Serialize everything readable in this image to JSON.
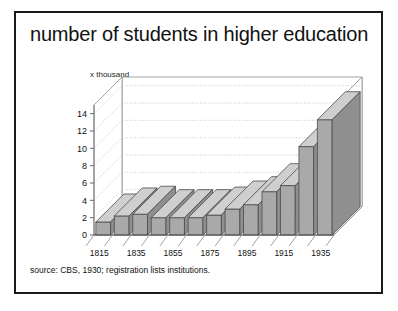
{
  "figure": {
    "title": "number of students in higher education",
    "source": "source: CBS, 1930; registration lists institutions.",
    "unit_label": "x thousand",
    "colors": {
      "panel_background": "#ffffff",
      "panel_border": "#1a1a1a",
      "bar_front": "#a9a9a9",
      "bar_side": "#8f8f8f",
      "bar_top": "#cfcfcf",
      "bar_outline": "#4a4a4a",
      "floor": "#ffffff",
      "gridline": "#bdbdbd",
      "axis": "#8a8a8a",
      "text": "#111111"
    }
  },
  "chart_data": {
    "type": "bar",
    "title": "number of students in higher education",
    "subtitle": "",
    "xlabel": "",
    "ylabel": "x thousand",
    "ylim": [
      0,
      15
    ],
    "yticks": [
      0,
      2,
      4,
      6,
      8,
      10,
      12,
      14
    ],
    "ytick_labels": [
      "0",
      "2",
      "4",
      "6",
      "8",
      "10",
      "12",
      "14"
    ],
    "grid": true,
    "legend": false,
    "threed": true,
    "annotation": "source: CBS, 1930; registration lists institutions.",
    "categories": [
      "1815",
      "1825",
      "1835",
      "1845",
      "1855",
      "1865",
      "1875",
      "1885",
      "1895",
      "1905",
      "1915",
      "1925",
      "1935"
    ],
    "xtick_labels_shown": [
      "1815",
      "1835",
      "1855",
      "1875",
      "1895",
      "1915",
      "1935"
    ],
    "values": [
      1.5,
      2.2,
      2.4,
      2.0,
      2.0,
      2.0,
      2.3,
      3.0,
      3.5,
      5.0,
      5.7,
      10.2,
      13.3
    ]
  }
}
